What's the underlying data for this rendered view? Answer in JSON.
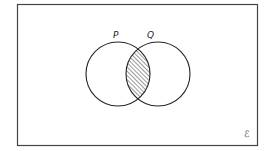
{
  "diagram": {
    "type": "venn",
    "universal_set_label": "ℰ",
    "frame": {
      "x": 17.5,
      "y": 4.5,
      "width": 240,
      "height": 141,
      "stroke": "#444444"
    },
    "sets": [
      {
        "label": "P",
        "cx": 118,
        "cy": 74,
        "r": 32,
        "label_x": 113,
        "label_y": 38
      },
      {
        "label": "Q",
        "cx": 158,
        "cy": 74,
        "r": 32,
        "label_x": 147,
        "label_y": 38
      }
    ],
    "shaded_region": "P ∩ Q",
    "shading": "diagonal-hatch",
    "line_color": "#222222"
  }
}
